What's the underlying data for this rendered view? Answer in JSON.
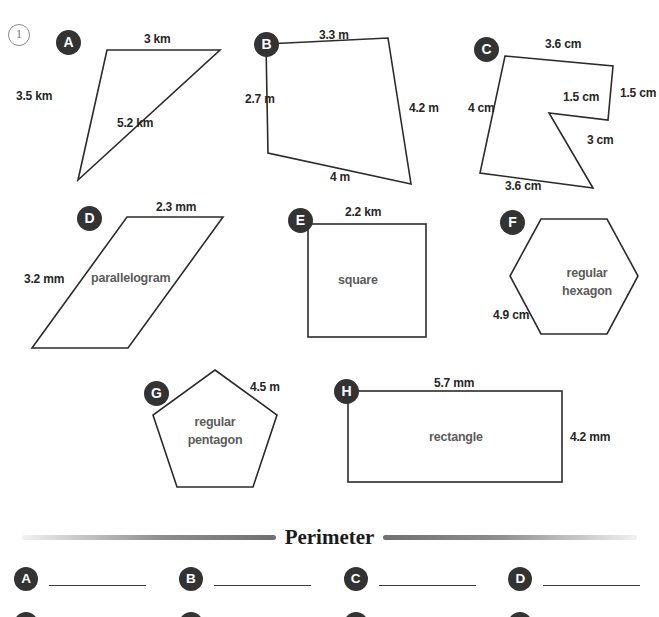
{
  "worksheet": {
    "problem_number": "1",
    "section_title": "Perimeter"
  },
  "shapes": [
    {
      "badge": "A",
      "name": "",
      "unit": "km",
      "labels": [
        "3 km",
        "3.5 km",
        "5.2 km"
      ]
    },
    {
      "badge": "B",
      "name": "",
      "unit": "m",
      "labels": [
        "3.3 m",
        "2.7 m",
        "4.2 m",
        "4 m"
      ]
    },
    {
      "badge": "C",
      "name": "",
      "unit": "cm",
      "labels": [
        "3.6 cm",
        "1.5 cm",
        "1.5 cm",
        "3 cm",
        "3.6 cm",
        "4 cm"
      ]
    },
    {
      "badge": "D",
      "name": "parallelogram",
      "unit": "mm",
      "labels": [
        "2.3 mm",
        "3.2 mm"
      ]
    },
    {
      "badge": "E",
      "name": "square",
      "unit": "km",
      "labels": [
        "2.2 km"
      ]
    },
    {
      "badge": "F",
      "name": "regular hexagon",
      "name_line1": "regular",
      "name_line2": "hexagon",
      "unit": "cm",
      "labels": [
        "4.9 cm"
      ]
    },
    {
      "badge": "G",
      "name": "regular pentagon",
      "name_line1": "regular",
      "name_line2": "pentagon",
      "unit": "m",
      "labels": [
        "4.5 m"
      ]
    },
    {
      "badge": "H",
      "name": "rectangle",
      "unit": "mm",
      "labels": [
        "5.7 mm",
        "4.2 mm"
      ]
    }
  ],
  "shape_a": {
    "badge": "A",
    "side_top": "3 km",
    "side_left": "3.5 km",
    "side_hyp": "5.2 km"
  },
  "shape_b": {
    "badge": "B",
    "side_top": "3.3 m",
    "side_left": "2.7 m",
    "side_right": "4.2 m",
    "side_bottom": "4 m"
  },
  "shape_c": {
    "badge": "C",
    "side_top": "3.6 cm",
    "side_left": "4 cm",
    "side_right": "1.5 cm",
    "side_notch": "1.5 cm",
    "side_diag": "3 cm",
    "side_bottom": "3.6 cm"
  },
  "shape_d": {
    "badge": "D",
    "label": "parallelogram",
    "side_top": "2.3 mm",
    "side_left": "3.2 mm"
  },
  "shape_e": {
    "badge": "E",
    "label": "square",
    "side_top": "2.2 km"
  },
  "shape_f": {
    "badge": "F",
    "label_line1": "regular",
    "label_line2": "hexagon",
    "side": "4.9 cm"
  },
  "shape_g": {
    "badge": "G",
    "label_line1": "regular",
    "label_line2": "pentagon",
    "side": "4.5 m"
  },
  "shape_h": {
    "badge": "H",
    "label": "rectangle",
    "side_top": "5.7 mm",
    "side_right": "4.2 mm"
  },
  "answers": {
    "rows": [
      [
        {
          "badge": "A"
        },
        {
          "badge": "B"
        },
        {
          "badge": "C"
        },
        {
          "badge": "D"
        }
      ],
      [
        {
          "badge": "E"
        },
        {
          "badge": "F"
        },
        {
          "badge": "G"
        },
        {
          "badge": "H"
        }
      ]
    ]
  },
  "colors": {
    "stroke": "#2b2b2b",
    "badge_bg": "#333333",
    "badge_fg": "#ffffff",
    "label_text": "#262626",
    "shape_name_text": "#5c5c5c",
    "rule": "#8d8d8d"
  }
}
